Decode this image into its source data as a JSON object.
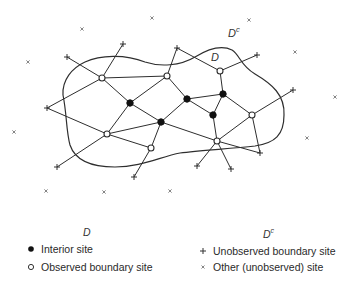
{
  "diagram": {
    "region_labels": {
      "inside": "D",
      "outside": "D",
      "outside_sup": "c"
    },
    "interior_sites": [
      {
        "id": "F1",
        "x": 130,
        "y": 103
      },
      {
        "id": "F2",
        "x": 161,
        "y": 122
      },
      {
        "id": "F3",
        "x": 187,
        "y": 99
      },
      {
        "id": "F4",
        "x": 223,
        "y": 94
      },
      {
        "id": "F5",
        "x": 213,
        "y": 115
      }
    ],
    "observed_boundary_sites": [
      {
        "id": "O1",
        "x": 102,
        "y": 78
      },
      {
        "id": "O2",
        "x": 167,
        "y": 76
      },
      {
        "id": "O3",
        "x": 220,
        "y": 71
      },
      {
        "id": "O4",
        "x": 107,
        "y": 134
      },
      {
        "id": "O5",
        "x": 151,
        "y": 148
      },
      {
        "id": "O6",
        "x": 252,
        "y": 115
      },
      {
        "id": "O7",
        "x": 217,
        "y": 141
      }
    ],
    "unobserved_boundary_sites": [
      {
        "id": "P1",
        "x": 67,
        "y": 57
      },
      {
        "id": "P2",
        "x": 123,
        "y": 44
      },
      {
        "id": "P3",
        "x": 177,
        "y": 48
      },
      {
        "id": "P4",
        "x": 257,
        "y": 55
      },
      {
        "id": "P5",
        "x": 293,
        "y": 90
      },
      {
        "id": "P6",
        "x": 47,
        "y": 108
      },
      {
        "id": "P7",
        "x": 57,
        "y": 167
      },
      {
        "id": "P8",
        "x": 134,
        "y": 177
      },
      {
        "id": "P9",
        "x": 260,
        "y": 153
      },
      {
        "id": "P10",
        "x": 197,
        "y": 166
      },
      {
        "id": "P11",
        "x": 231,
        "y": 169
      }
    ],
    "other_sites": [
      {
        "x": 28,
        "y": 62
      },
      {
        "x": 82,
        "y": 29
      },
      {
        "x": 152,
        "y": 18
      },
      {
        "x": 249,
        "y": 20
      },
      {
        "x": 295,
        "y": 52
      },
      {
        "x": 335,
        "y": 97
      },
      {
        "x": 14,
        "y": 132
      },
      {
        "x": 307,
        "y": 138
      },
      {
        "x": 46,
        "y": 191
      },
      {
        "x": 104,
        "y": 192
      },
      {
        "x": 170,
        "y": 191
      }
    ],
    "edges": [
      [
        "P1",
        "O1"
      ],
      [
        "P2",
        "O1"
      ],
      [
        "P6",
        "O1"
      ],
      [
        "O1",
        "O2"
      ],
      [
        "O1",
        "F1"
      ],
      [
        "O2",
        "P3"
      ],
      [
        "O2",
        "F1"
      ],
      [
        "O2",
        "F3"
      ],
      [
        "P3",
        "O3"
      ],
      [
        "O3",
        "P4"
      ],
      [
        "O3",
        "F4"
      ],
      [
        "F3",
        "F4"
      ],
      [
        "F3",
        "F5"
      ],
      [
        "F3",
        "F2"
      ],
      [
        "F4",
        "F5"
      ],
      [
        "F4",
        "O6"
      ],
      [
        "O6",
        "P5"
      ],
      [
        "O6",
        "P9"
      ],
      [
        "O6",
        "O7"
      ],
      [
        "F5",
        "O7"
      ],
      [
        "F2",
        "O7"
      ],
      [
        "F1",
        "F2"
      ],
      [
        "F1",
        "O4"
      ],
      [
        "P6",
        "O4"
      ],
      [
        "O4",
        "P7"
      ],
      [
        "O4",
        "F2"
      ],
      [
        "O4",
        "O5"
      ],
      [
        "F2",
        "O5"
      ],
      [
        "O5",
        "P8"
      ],
      [
        "O7",
        "P9"
      ],
      [
        "O7",
        "P10"
      ],
      [
        "O7",
        "P11"
      ]
    ]
  },
  "legend": {
    "left_heading": "D",
    "right_heading": "D",
    "right_heading_sup": "c",
    "items": [
      {
        "marker": "filled-circle-icon",
        "label": "Interior site"
      },
      {
        "marker": "open-circle-icon",
        "label": "Observed boundary site"
      },
      {
        "marker": "plus-icon",
        "label": "Unobserved boundary site"
      },
      {
        "marker": "cross-icon",
        "label": "Other (unobserved) site"
      }
    ]
  }
}
